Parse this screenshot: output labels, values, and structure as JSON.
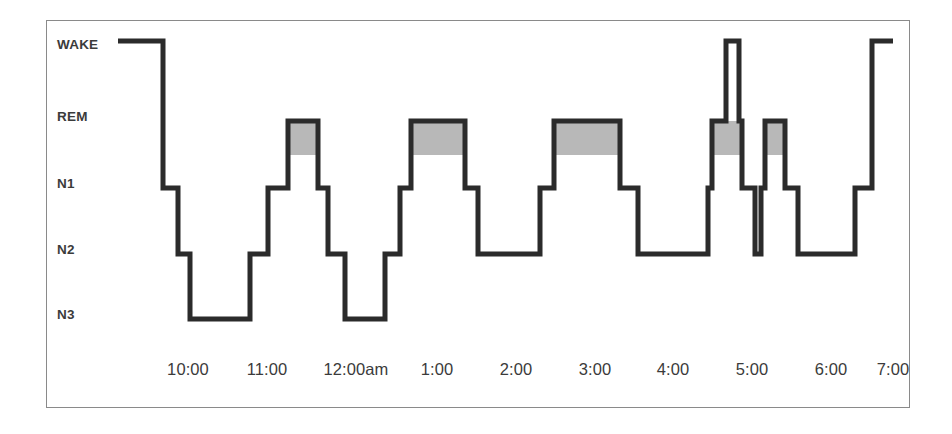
{
  "chart_data": {
    "type": "line",
    "title": "",
    "subtitle": "",
    "xlabel": "",
    "ylabel": "",
    "grid": false,
    "legend": "none",
    "stage_levels": [
      "WAKE",
      "REM",
      "N1",
      "N2",
      "N3"
    ],
    "y_tick_labels": [
      "WAKE",
      "REM",
      "N1",
      "N2",
      "N3"
    ],
    "x_tick_labels": [
      "10:00",
      "11:00",
      "12:00am",
      "1:00",
      "2:00",
      "3:00",
      "4:00",
      "5:00",
      "6:00",
      "7:00"
    ],
    "xlim": [
      "21:45",
      "07:10"
    ],
    "rem_fill_color": "#b8b8b8",
    "trace_color": "#2b2b2b",
    "frame_color": "#8a8a8a",
    "segments": [
      {
        "stage": "WAKE",
        "start": "21:45",
        "end": "22:16"
      },
      {
        "stage": "N1",
        "start": "22:16",
        "end": "22:26"
      },
      {
        "stage": "N2",
        "start": "22:26",
        "end": "22:34"
      },
      {
        "stage": "N3",
        "start": "22:34",
        "end": "23:15"
      },
      {
        "stage": "N2",
        "start": "23:15",
        "end": "23:27"
      },
      {
        "stage": "N1",
        "start": "23:27",
        "end": "23:41"
      },
      {
        "stage": "REM",
        "start": "23:41",
        "end": "00:01"
      },
      {
        "stage": "N1",
        "start": "00:01",
        "end": "00:08"
      },
      {
        "stage": "N2",
        "start": "00:08",
        "end": "00:19"
      },
      {
        "stage": "N3",
        "start": "00:19",
        "end": "00:46"
      },
      {
        "stage": "N2",
        "start": "00:46",
        "end": "00:56"
      },
      {
        "stage": "N1",
        "start": "00:56",
        "end": "01:06"
      },
      {
        "stage": "REM",
        "start": "01:06",
        "end": "01:43"
      },
      {
        "stage": "N1",
        "start": "01:43",
        "end": "01:52"
      },
      {
        "stage": "N2",
        "start": "01:52",
        "end": "02:33"
      },
      {
        "stage": "N1",
        "start": "02:33",
        "end": "02:44"
      },
      {
        "stage": "REM",
        "start": "02:44",
        "end": "03:29"
      },
      {
        "stage": "N1",
        "start": "03:29",
        "end": "03:41"
      },
      {
        "stage": "N2",
        "start": "03:41",
        "end": "04:29"
      },
      {
        "stage": "N1",
        "start": "04:29",
        "end": "04:42"
      },
      {
        "stage": "REM",
        "start": "04:42",
        "end": "04:52"
      },
      {
        "stage": "WAKE",
        "start": "04:52",
        "end": "04:55"
      },
      {
        "stage": "REM",
        "start": "04:55",
        "end": "05:02"
      },
      {
        "stage": "N1",
        "start": "05:02",
        "end": "05:17"
      },
      {
        "stage": "REM",
        "start": "05:17",
        "end": "05:31"
      },
      {
        "stage": "N1",
        "start": "05:31",
        "end": "05:40"
      },
      {
        "stage": "N2",
        "start": "05:40",
        "end": "06:19"
      },
      {
        "stage": "N1",
        "start": "06:19",
        "end": "06:30"
      },
      {
        "stage": "WAKE",
        "start": "06:30",
        "end": "06:58"
      }
    ],
    "rem_blocks": [
      {
        "start": "23:41",
        "end": "00:01"
      },
      {
        "start": "01:06",
        "end": "01:43"
      },
      {
        "start": "02:44",
        "end": "03:29"
      },
      {
        "start": "04:42",
        "end": "05:02"
      },
      {
        "start": "05:17",
        "end": "05:31"
      }
    ],
    "pixel_geometry": {
      "note": "device pixel coordinates of the drawn polyline in the source image",
      "y_levels": {
        "WAKE": 41,
        "REM": 121,
        "N1": 188,
        "N2": 254,
        "N3": 319
      },
      "x_ticks": {
        "10:00": 188,
        "11:00": 267,
        "12:00am": 356,
        "1:00": 437,
        "2:00": 516,
        "3:00": 595,
        "4:00": 673,
        "5:00": 752,
        "6:00": 831,
        "7:00": 893
      },
      "polyline": [
        [
          118,
          41
        ],
        [
          163,
          41
        ],
        [
          163,
          188
        ],
        [
          178,
          188
        ],
        [
          178,
          254
        ],
        [
          190,
          254
        ],
        [
          190,
          319
        ],
        [
          250,
          319
        ],
        [
          250,
          254
        ],
        [
          268,
          254
        ],
        [
          268,
          188
        ],
        [
          288,
          188
        ],
        [
          288,
          121
        ],
        [
          318,
          121
        ],
        [
          318,
          188
        ],
        [
          328,
          188
        ],
        [
          328,
          254
        ],
        [
          345,
          254
        ],
        [
          345,
          319
        ],
        [
          385,
          319
        ],
        [
          385,
          254
        ],
        [
          400,
          254
        ],
        [
          400,
          188
        ],
        [
          411,
          188
        ],
        [
          411,
          121
        ],
        [
          465,
          121
        ],
        [
          465,
          188
        ],
        [
          478,
          188
        ],
        [
          478,
          254
        ],
        [
          540,
          254
        ],
        [
          540,
          188
        ],
        [
          554,
          188
        ],
        [
          554,
          121
        ],
        [
          620,
          121
        ],
        [
          620,
          188
        ],
        [
          638,
          188
        ],
        [
          638,
          254
        ],
        [
          708,
          254
        ],
        [
          708,
          188
        ],
        [
          712,
          188
        ],
        [
          712,
          121
        ],
        [
          726,
          121
        ],
        [
          726,
          41
        ],
        [
          739,
          41
        ],
        [
          739,
          121
        ],
        [
          742,
          121
        ],
        [
          742,
          188
        ],
        [
          755,
          188
        ],
        [
          755,
          254
        ],
        [
          761,
          254
        ],
        [
          761,
          188
        ],
        [
          765,
          188
        ],
        [
          765,
          121
        ],
        [
          785,
          121
        ],
        [
          785,
          188
        ],
        [
          798,
          188
        ],
        [
          798,
          254
        ],
        [
          855,
          254
        ],
        [
          855,
          188
        ],
        [
          872,
          188
        ],
        [
          872,
          41
        ],
        [
          893,
          41
        ]
      ],
      "rem_rects": [
        {
          "x": 288,
          "y": 121,
          "w": 30,
          "h": 34
        },
        {
          "x": 411,
          "y": 121,
          "w": 54,
          "h": 34
        },
        {
          "x": 554,
          "y": 121,
          "w": 66,
          "h": 34
        },
        {
          "x": 712,
          "y": 121,
          "w": 30,
          "h": 34
        },
        {
          "x": 765,
          "y": 121,
          "w": 20,
          "h": 34
        }
      ]
    }
  }
}
